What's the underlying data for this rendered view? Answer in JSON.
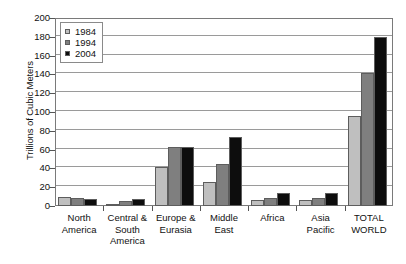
{
  "chart_data": {
    "type": "bar",
    "title": "",
    "xlabel": "",
    "ylabel": "Trillions of Cubic Meters",
    "ylim": [
      0,
      200
    ],
    "ytick_step": 20,
    "yticks": [
      0,
      20,
      40,
      60,
      80,
      100,
      120,
      140,
      160,
      180,
      200
    ],
    "grid": true,
    "legend_position": "top-left",
    "categories": [
      "North America",
      "Central & South America",
      "Europe & Eurasia",
      "Middle East",
      "Africa",
      "Asia Pacific",
      "TOTAL WORLD"
    ],
    "category_lines": [
      [
        "North",
        "America"
      ],
      [
        "Central &",
        "South",
        "America"
      ],
      [
        "Europe &",
        "Eurasia"
      ],
      [
        "Middle",
        "East"
      ],
      [
        "Africa"
      ],
      [
        "Asia",
        "Pacific"
      ],
      [
        "TOTAL",
        "WORLD"
      ]
    ],
    "series": [
      {
        "name": "1984",
        "color": "#bfbfbf",
        "values": [
          10,
          2,
          41,
          26,
          6,
          6,
          96
        ]
      },
      {
        "name": "1994",
        "color": "#7f7f7f",
        "values": [
          8,
          5,
          63,
          45,
          9,
          9,
          142
        ]
      },
      {
        "name": "2004",
        "color": "#0d0d0d",
        "values": [
          7,
          7,
          63,
          73,
          14,
          14,
          180
        ]
      }
    ]
  },
  "legend": {
    "items": [
      {
        "label": "1984",
        "color": "#bfbfbf"
      },
      {
        "label": "1994",
        "color": "#7f7f7f"
      },
      {
        "label": "2004",
        "color": "#0d0d0d"
      }
    ]
  },
  "axis": {
    "y_title": "Trillions of Cubic Meters"
  }
}
